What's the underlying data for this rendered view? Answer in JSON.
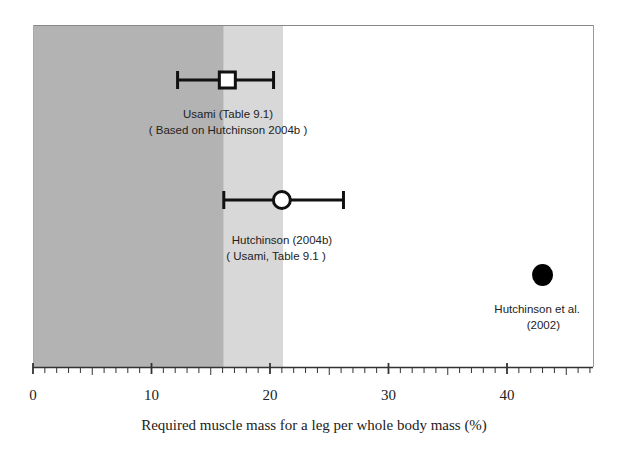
{
  "chart_data": {
    "type": "scatter",
    "title": "",
    "xlabel": "Required muscle mass for a leg per whole body mass    (%)",
    "ylabel": "",
    "xlim": [
      0,
      47.3
    ],
    "x_ticks": [
      0,
      10,
      20,
      30,
      40
    ],
    "x_tick_labels": [
      "0",
      "10",
      "20",
      "30",
      "40"
    ],
    "minor_tick_step": 1,
    "grid": false,
    "legend": null,
    "shaded_regions": [
      {
        "from": 0,
        "to": 16.1,
        "color": "#b3b3b3",
        "name": "dark-band"
      },
      {
        "from": 16.1,
        "to": 21.1,
        "color": "#d8d8d8",
        "name": "light-band"
      }
    ],
    "points": [
      {
        "name": "Usami (Table 9.1)",
        "marker": "open-square",
        "x": 16.4,
        "x_low": 12.2,
        "x_high": 20.3,
        "row": 1,
        "label_lines": [
          "Usami  (Table 9.1)",
          "( Based on Hutchinson  2004b  )"
        ]
      },
      {
        "name": "Hutchinson (2004b)",
        "marker": "open-circle",
        "x": 21.0,
        "x_low": 16.1,
        "x_high": 26.2,
        "row": 2,
        "label_lines": [
          "Hutchinson (2004b)",
          "( Usami, Table 9.1 )"
        ]
      },
      {
        "name": "Hutchinson et al. (2002)",
        "marker": "filled-circle",
        "x": 43.0,
        "row": 3,
        "label_lines": [
          "Hutchinson  et al.",
          "(2002)"
        ]
      }
    ]
  }
}
